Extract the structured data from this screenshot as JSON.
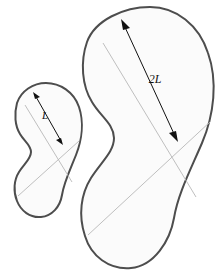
{
  "figure": {
    "title": "Two similar bean shapes with linear dimension labels",
    "background_color": "#ffffff",
    "outline_color": "#4d4d4d",
    "fill_color": "#fbfbfb",
    "chord_color": "#b8b8b8",
    "arrow_color": "#111111"
  },
  "shapes": [
    {
      "id": "small-bean",
      "name": "small bean shape",
      "scale_factor": "1",
      "dimension_label": "L",
      "outline_color": "#4d4d4d",
      "fill_color": "#fbfbfb"
    },
    {
      "id": "large-bean",
      "name": "large bean shape",
      "scale_factor": "2",
      "dimension_label": "2L",
      "outline_color": "#4d4d4d",
      "fill_color": "#fbfbfb"
    }
  ],
  "labels": {
    "small_dimension": "L",
    "large_dimension": "2L"
  }
}
